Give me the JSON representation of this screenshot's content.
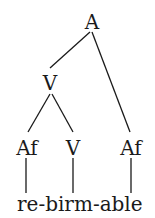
{
  "diagram": {
    "type": "morphological-tree",
    "nodes": {
      "root": "A",
      "mid": "V",
      "leaf_affix_left": "Af",
      "leaf_verb": "V",
      "leaf_affix_right": "Af"
    },
    "word": "re-birm-able",
    "colors": {
      "ink": "#1a1a1a",
      "background": "#ffffff"
    }
  }
}
